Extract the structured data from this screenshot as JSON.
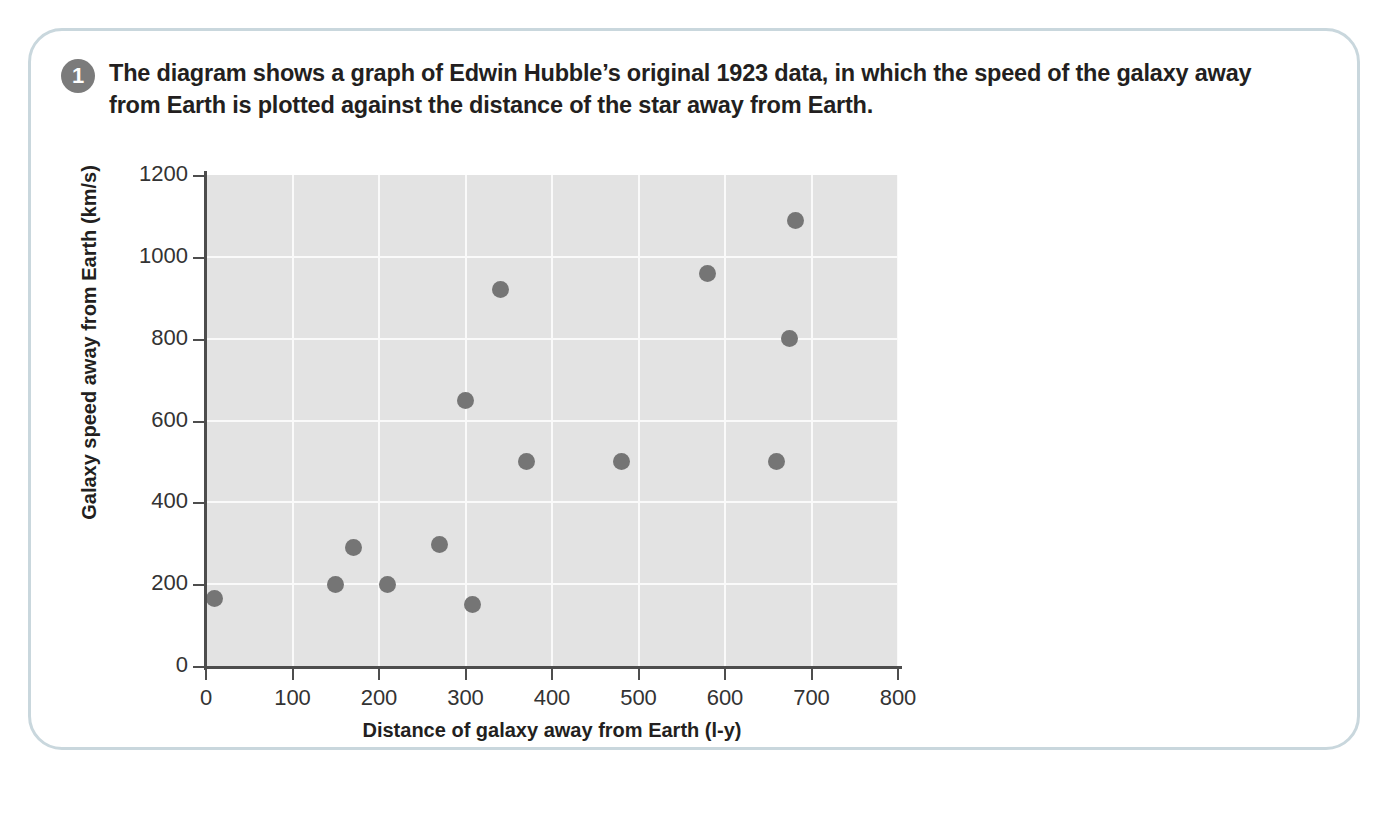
{
  "question": {
    "number": "1",
    "text": "The diagram shows a graph of Edwin Hubble’s original 1923 data, in which the speed of the galaxy away from Earth is plotted against the distance of the star away from Earth."
  },
  "colors": {
    "plot_background": "#e3e3e3",
    "gridline": "#fafafa",
    "point": "#757575",
    "axis": "#4d4d4d",
    "card_border": "#c9d7dd",
    "bullet": "#7b7b7b"
  },
  "chart_data": {
    "type": "scatter",
    "title": "",
    "xlabel": "Distance of galaxy away from Earth (l-y)",
    "ylabel": "Galaxy speed away from Earth (km/s)",
    "xlim": [
      0,
      800
    ],
    "ylim": [
      0,
      1200
    ],
    "xticks": [
      0,
      100,
      200,
      300,
      400,
      500,
      600,
      700,
      800
    ],
    "yticks": [
      0,
      200,
      400,
      600,
      800,
      1000,
      1200
    ],
    "xtick_labels": [
      "0",
      "100",
      "200",
      "300",
      "400",
      "500",
      "600",
      "700",
      "800"
    ],
    "ytick_labels": [
      "0",
      "200",
      "400",
      "600",
      "800",
      "1000",
      "1200"
    ],
    "grid": true,
    "legend": false,
    "points": [
      {
        "x": 10,
        "y": 165
      },
      {
        "x": 150,
        "y": 200
      },
      {
        "x": 170,
        "y": 290
      },
      {
        "x": 210,
        "y": 200
      },
      {
        "x": 270,
        "y": 298
      },
      {
        "x": 300,
        "y": 650
      },
      {
        "x": 308,
        "y": 150
      },
      {
        "x": 340,
        "y": 920
      },
      {
        "x": 370,
        "y": 500
      },
      {
        "x": 480,
        "y": 500
      },
      {
        "x": 580,
        "y": 960
      },
      {
        "x": 660,
        "y": 500
      },
      {
        "x": 675,
        "y": 800
      },
      {
        "x": 682,
        "y": 1090
      }
    ]
  }
}
